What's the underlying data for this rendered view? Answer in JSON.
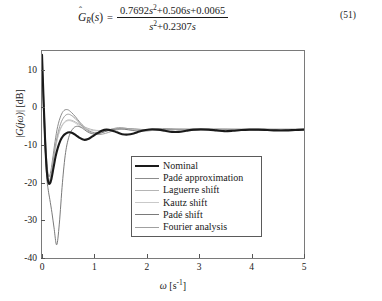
{
  "equation": {
    "lhs_symbol": "G",
    "lhs_hat": "ˆ",
    "lhs_subscript": "R",
    "lhs_arg_open": "(",
    "lhs_arg_var": "s",
    "lhs_arg_close": ")",
    "equals": "=",
    "numerator": "0.7692s² + 0.506s + 0.0065",
    "numerator_parts": {
      "c1": "0.7692",
      "v1": "s",
      "p1": "2",
      "op1": "+",
      "c2": "0.506",
      "v2": "s",
      "op2": "+",
      "c3": "0.0065"
    },
    "denominator": "s² + 0.2307s",
    "denominator_parts": {
      "v1": "s",
      "p1": "2",
      "op1": "+",
      "c2": "0.2307",
      "v2": "s"
    },
    "number": "(51)"
  },
  "figure": {
    "xlabel_symbol": "ω",
    "xlabel_units": "[s",
    "xlabel_units_sup": "-1",
    "xlabel_units_close": "]",
    "ylabel": "|G(jω)| [dB]",
    "ylabel_parts": {
      "bar_open": "|",
      "g": "G",
      "arg": "(jω)",
      "bar_close": "|",
      "units": " [dB]"
    }
  },
  "legend": {
    "items": [
      {
        "label": "Nominal",
        "color": "#1a1a1a",
        "width": 2.1
      },
      {
        "label": "Padé approximation",
        "color": "#8c8c8c",
        "width": 1.0
      },
      {
        "label": "Laguerre shift",
        "color": "#b5b5b5",
        "width": 1.0
      },
      {
        "label": "Kautz shift",
        "color": "#c9c9c9",
        "width": 1.0
      },
      {
        "label": "Padé shift",
        "color": "#7a7a7a",
        "width": 1.0
      },
      {
        "label": "Fourier analysis",
        "color": "#a0a0a0",
        "width": 1.0
      }
    ]
  },
  "chart_data": {
    "type": "line",
    "title": "",
    "xlabel": "ω [s-1]",
    "ylabel": "|G(jω)| [dB]",
    "xlim": [
      0,
      5
    ],
    "ylim": [
      -40,
      15
    ],
    "xticks": [
      0,
      1,
      2,
      3,
      4,
      5
    ],
    "yticks": [
      10,
      0,
      -10,
      -20,
      -30,
      -40
    ],
    "grid": false,
    "legend_position": "lower-right-inside",
    "series": [
      {
        "name": "Nominal",
        "color": "#1a1a1a",
        "width": 2.1,
        "x": [
          0.0,
          0.03,
          0.06,
          0.09,
          0.12,
          0.15,
          0.18,
          0.22,
          0.26,
          0.3,
          0.35,
          0.4,
          0.46,
          0.52,
          0.58,
          0.65,
          0.72,
          0.8,
          0.88,
          0.96,
          1.05,
          1.14,
          1.23,
          1.33,
          1.43,
          1.53,
          1.64,
          1.75,
          1.86,
          1.98,
          2.1,
          2.22,
          2.35,
          2.48,
          2.61,
          2.75,
          2.89,
          3.03,
          3.18,
          3.33,
          3.48,
          3.64,
          3.8,
          3.96,
          4.13,
          4.3,
          4.47,
          4.65,
          4.83,
          5.0
        ],
        "y": [
          14.0,
          2.0,
          -9.0,
          -16.5,
          -19.8,
          -20.2,
          -19.0,
          -16.0,
          -13.0,
          -10.8,
          -8.8,
          -7.6,
          -6.9,
          -6.6,
          -6.8,
          -7.4,
          -8.1,
          -8.6,
          -8.4,
          -7.7,
          -6.9,
          -6.2,
          -5.9,
          -6.1,
          -6.6,
          -7.1,
          -7.2,
          -6.9,
          -6.4,
          -6.0,
          -5.8,
          -5.9,
          -6.2,
          -6.5,
          -6.5,
          -6.2,
          -5.9,
          -5.8,
          -5.9,
          -6.1,
          -6.3,
          -6.2,
          -6.0,
          -5.9,
          -5.9,
          -6.0,
          -6.1,
          -6.1,
          -6.0,
          -5.9
        ]
      },
      {
        "name": "Padé approximation",
        "color": "#8c8c8c",
        "width": 1.0,
        "x": [
          0.0,
          0.04,
          0.08,
          0.12,
          0.16,
          0.2,
          0.25,
          0.3,
          0.36,
          0.42,
          0.49,
          0.56,
          0.64,
          0.72,
          0.81,
          0.9,
          1.0,
          1.11,
          1.22,
          1.34,
          1.46,
          1.59,
          1.72,
          1.86,
          2.0,
          2.15,
          2.3,
          2.46,
          2.62,
          2.79,
          2.96,
          3.14,
          3.32,
          3.51,
          3.7,
          3.9,
          4.1,
          4.31,
          4.52,
          4.74,
          5.0
        ],
        "y": [
          13.0,
          0.0,
          -12.0,
          -18.0,
          -17.5,
          -14.0,
          -9.0,
          -5.0,
          -2.2,
          -0.8,
          -0.6,
          -1.3,
          -2.5,
          -3.9,
          -5.2,
          -6.2,
          -6.7,
          -6.6,
          -6.2,
          -5.7,
          -5.4,
          -5.5,
          -5.8,
          -6.0,
          -6.0,
          -5.8,
          -5.6,
          -5.6,
          -5.8,
          -5.9,
          -5.9,
          -5.8,
          -5.7,
          -5.7,
          -5.8,
          -5.9,
          -5.9,
          -5.8,
          -5.8,
          -5.8,
          -5.8
        ]
      },
      {
        "name": "Laguerre shift",
        "color": "#b5b5b5",
        "width": 1.0,
        "x": [
          0.0,
          0.04,
          0.08,
          0.12,
          0.17,
          0.22,
          0.28,
          0.34,
          0.41,
          0.48,
          0.56,
          0.64,
          0.73,
          0.83,
          0.93,
          1.04,
          1.16,
          1.28,
          1.41,
          1.55,
          1.69,
          1.84,
          2.0,
          2.17,
          2.34,
          2.52,
          2.71,
          2.9,
          3.1,
          3.31,
          3.53,
          3.75,
          3.98,
          4.22,
          4.47,
          4.73,
          5.0
        ],
        "y": [
          12.0,
          -2.0,
          -14.0,
          -19.5,
          -18.0,
          -13.5,
          -9.0,
          -6.0,
          -4.2,
          -3.4,
          -3.4,
          -3.9,
          -4.6,
          -5.3,
          -5.8,
          -6.1,
          -6.1,
          -5.9,
          -5.7,
          -5.6,
          -5.7,
          -5.8,
          -5.9,
          -5.9,
          -5.8,
          -5.7,
          -5.7,
          -5.8,
          -5.8,
          -5.8,
          -5.8,
          -5.8,
          -5.8,
          -5.8,
          -5.8,
          -5.8,
          -5.8
        ]
      },
      {
        "name": "Kautz shift",
        "color": "#c9c9c9",
        "width": 1.0,
        "x": [
          0.0,
          0.04,
          0.09,
          0.14,
          0.19,
          0.25,
          0.31,
          0.38,
          0.45,
          0.53,
          0.62,
          0.71,
          0.81,
          0.92,
          1.03,
          1.15,
          1.28,
          1.42,
          1.56,
          1.71,
          1.87,
          2.04,
          2.21,
          2.39,
          2.58,
          2.78,
          2.99,
          3.2,
          3.42,
          3.65,
          3.89,
          4.14,
          4.4,
          4.69,
          5.0
        ],
        "y": [
          11.0,
          -4.0,
          -16.0,
          -20.0,
          -16.5,
          -11.5,
          -7.5,
          -5.0,
          -3.8,
          -3.5,
          -4.0,
          -4.8,
          -5.5,
          -6.0,
          -6.2,
          -6.1,
          -5.9,
          -5.7,
          -5.7,
          -5.8,
          -5.9,
          -5.9,
          -5.8,
          -5.8,
          -5.8,
          -5.8,
          -5.8,
          -5.8,
          -5.8,
          -5.8,
          -5.8,
          -5.8,
          -5.8,
          -5.8,
          -5.8
        ]
      },
      {
        "name": "Padé shift",
        "color": "#7a7a7a",
        "width": 1.0,
        "x": [
          0.0,
          0.03,
          0.06,
          0.09,
          0.12,
          0.15,
          0.19,
          0.23,
          0.28,
          0.33,
          0.39,
          0.45,
          0.52,
          0.6,
          0.68,
          0.77,
          0.86,
          0.96,
          1.07,
          1.19,
          1.31,
          1.44,
          1.58,
          1.72,
          1.87,
          2.03,
          2.2,
          2.37,
          2.55,
          2.74,
          2.94,
          3.15,
          3.37,
          3.6,
          3.84,
          4.09,
          4.35,
          4.62,
          4.9,
          5.0
        ],
        "y": [
          13.5,
          1.0,
          -10.5,
          -18.5,
          -22.0,
          -24.5,
          -28.0,
          -32.0,
          -36.5,
          -31.0,
          -20.0,
          -12.0,
          -7.5,
          -5.5,
          -5.0,
          -5.5,
          -6.4,
          -7.0,
          -7.0,
          -6.5,
          -6.0,
          -5.7,
          -5.8,
          -6.1,
          -6.3,
          -6.2,
          -6.0,
          -5.9,
          -5.9,
          -6.0,
          -6.1,
          -6.0,
          -5.9,
          -5.9,
          -5.9,
          -6.0,
          -6.0,
          -5.9,
          -5.9,
          -5.9
        ]
      },
      {
        "name": "Fourier analysis",
        "color": "#a0a0a0",
        "width": 1.0,
        "x": [
          0.0,
          0.03,
          0.07,
          0.11,
          0.15,
          0.2,
          0.25,
          0.31,
          0.37,
          0.44,
          0.51,
          0.59,
          0.68,
          0.77,
          0.87,
          0.98,
          1.09,
          1.21,
          1.34,
          1.48,
          1.62,
          1.77,
          1.93,
          2.1,
          2.28,
          2.46,
          2.65,
          2.85,
          3.06,
          3.28,
          3.51,
          3.75,
          4.0,
          4.26,
          4.53,
          4.76,
          5.0
        ],
        "y": [
          12.5,
          -1.0,
          -13.0,
          -19.0,
          -19.5,
          -15.5,
          -10.5,
          -6.5,
          -3.8,
          -2.2,
          -1.8,
          -2.4,
          -3.6,
          -5.0,
          -6.2,
          -7.0,
          -7.2,
          -6.9,
          -6.3,
          -5.8,
          -5.6,
          -5.7,
          -5.9,
          -6.1,
          -6.1,
          -5.9,
          -5.8,
          -5.8,
          -5.9,
          -5.9,
          -5.9,
          -5.8,
          -5.8,
          -5.8,
          -5.9,
          -5.9,
          -5.8
        ]
      }
    ]
  }
}
